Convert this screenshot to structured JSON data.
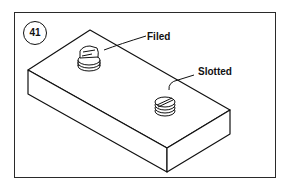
{
  "figure": {
    "number": "41",
    "labels": {
      "filed": "Filed",
      "slotted": "Slotted"
    },
    "colors": {
      "line": "#111111",
      "frame": "#2a2a2a",
      "background": "#ffffff"
    }
  }
}
